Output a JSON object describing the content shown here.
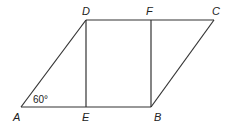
{
  "figure": {
    "type": "parallelogram with two perpendiculars",
    "stroke_color": "#333333",
    "points": {
      "A": {
        "label": "A",
        "x": 21,
        "y": 107
      },
      "E": {
        "label": "E",
        "x": 86,
        "y": 107
      },
      "B": {
        "label": "B",
        "x": 151,
        "y": 107
      },
      "D": {
        "label": "D",
        "x": 86,
        "y": 20
      },
      "F": {
        "label": "F",
        "x": 151,
        "y": 20
      },
      "C": {
        "label": "C",
        "x": 214,
        "y": 20
      }
    },
    "segments": [
      "AB",
      "DC",
      "AD",
      "BC",
      "DE",
      "FB"
    ],
    "angle_label": "60°",
    "angle_vertex": "A"
  }
}
